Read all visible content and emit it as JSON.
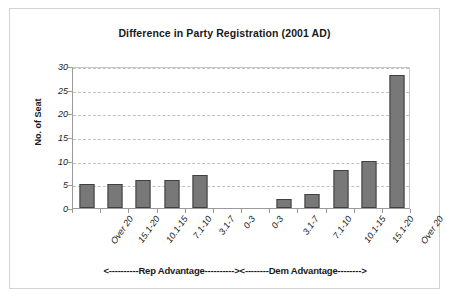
{
  "chart_data": {
    "type": "bar",
    "title": "Difference in Party Registration (2001 AD)",
    "xlabel": "",
    "ylabel": "No. of Seat",
    "ylim": [
      0,
      30
    ],
    "yticks": [
      0,
      5,
      10,
      15,
      20,
      25,
      30
    ],
    "grid": true,
    "legend": null,
    "categories": [
      "Over 20",
      "15.1-20",
      "10.1-15",
      "7.1-10",
      "3.1-7",
      "0-3",
      "0-3",
      "3.1-7",
      "7.1-10",
      "10.1-15",
      "15.1-20",
      "Over 20"
    ],
    "values": [
      5,
      5,
      6,
      6,
      7,
      0,
      0,
      2,
      3,
      8,
      10,
      28
    ],
    "annotations": [
      "<----------Rep Advantage---------->",
      "<--------Dem Advantage-------->"
    ],
    "bar_color": "#787878",
    "bar_border_color": "#404040",
    "gridline_color": "#c0c0c0",
    "axis_color": "#9a9a9a",
    "frame_color": "#d2d2d2"
  }
}
